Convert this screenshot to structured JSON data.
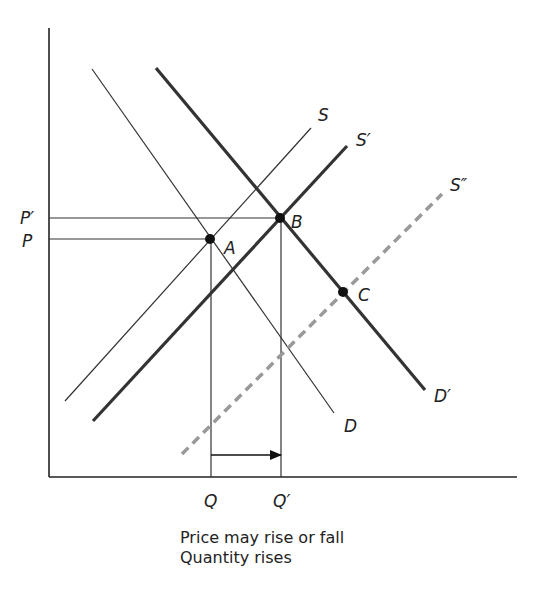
{
  "axes": {
    "origin": {
      "x": 49,
      "y": 477
    },
    "y_top": 28,
    "x_right": 517,
    "color": "#222222"
  },
  "curves": {
    "S": {
      "label": "S",
      "x1": 65,
      "y1": 401,
      "x2": 311,
      "y2": 128,
      "label_x": 318,
      "label_y": 121,
      "width": 1.2,
      "color": "#333333",
      "dash": ""
    },
    "S1": {
      "label": "S′",
      "x1": 93,
      "y1": 421,
      "x2": 347,
      "y2": 146,
      "label_x": 356,
      "label_y": 146,
      "width": 3.2,
      "color": "#333333",
      "dash": ""
    },
    "S2": {
      "label": "S″",
      "x1": 182,
      "y1": 454,
      "x2": 442,
      "y2": 194,
      "label_x": 450,
      "label_y": 191,
      "width": 3.5,
      "color": "#999999",
      "dash": "9,6"
    },
    "D": {
      "label": "D",
      "x1": 92,
      "y1": 69,
      "x2": 334,
      "y2": 413,
      "label_x": 344,
      "label_y": 432,
      "width": 1.2,
      "color": "#333333",
      "dash": ""
    },
    "D1": {
      "label": "D′",
      "x1": 156,
      "y1": 68,
      "x2": 425,
      "y2": 390,
      "label_x": 434,
      "label_y": 402,
      "width": 3.2,
      "color": "#333333",
      "dash": ""
    }
  },
  "points": {
    "A": {
      "label": "A",
      "x": 210,
      "y": 239,
      "label_x": 224,
      "label_y": 254
    },
    "B": {
      "label": "B",
      "x": 280,
      "y": 218,
      "label_x": 291,
      "label_y": 228
    },
    "C": {
      "label": "C",
      "x": 343,
      "y": 292,
      "label_x": 358,
      "label_y": 301
    }
  },
  "price_labels": {
    "P1": {
      "label": "P′",
      "y": 218,
      "label_x": 20,
      "label_y": 224
    },
    "P": {
      "label": "P",
      "y": 239,
      "label_x": 22,
      "label_y": 247
    }
  },
  "quantity_labels": {
    "Q": {
      "label": "Q",
      "x": 211,
      "label_x": 204,
      "label_y": 507
    },
    "Q1": {
      "label": "Q′",
      "x": 281,
      "label_x": 273,
      "label_y": 507
    }
  },
  "arrow": {
    "x1": 211,
    "x2": 281,
    "y": 455,
    "label": "quantity increase Q to Q′"
  },
  "caption": {
    "line1": "Price may rise or fall",
    "line2": "Quantity rises",
    "x": 180,
    "y1": 543,
    "y2": 563
  }
}
